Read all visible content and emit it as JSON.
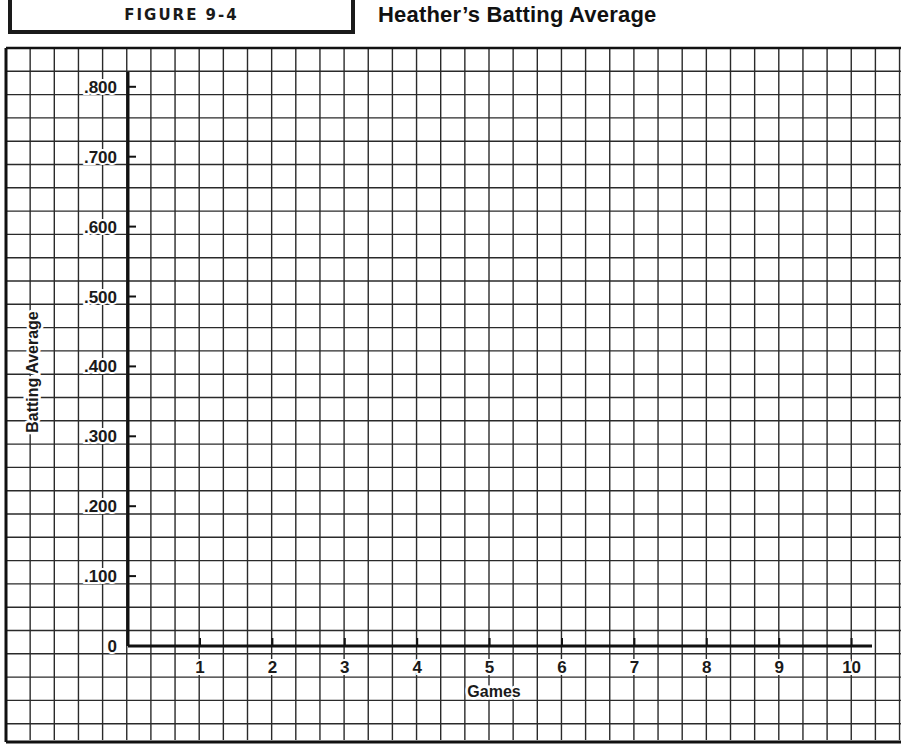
{
  "header": {
    "figure_label": "FIGURE 9-4",
    "title": "Heather’s Batting Average"
  },
  "chart_data": {
    "type": "line",
    "title": "Heather’s Batting Average",
    "xlabel": "Games",
    "ylabel": "Batting Average",
    "x_ticks": [
      "1",
      "2",
      "3",
      "4",
      "5",
      "6",
      "7",
      "8",
      "9",
      "10"
    ],
    "y_ticks": [
      "0",
      ".100",
      ".200",
      ".300",
      ".400",
      ".500",
      ".600",
      ".700",
      ".800"
    ],
    "xlim": [
      0,
      10
    ],
    "ylim": [
      0,
      0.8
    ],
    "grid": true,
    "series": [],
    "note": "Blank graph-paper template; no data plotted"
  },
  "colors": {
    "grid": "#2a2a2a",
    "axis": "#111111",
    "background": "#ffffff"
  }
}
